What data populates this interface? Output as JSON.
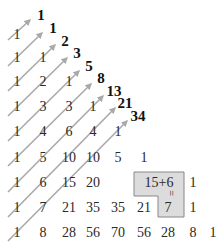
{
  "colors": {
    "arrow": "#a9a9a9",
    "box_fill": "#dcdcdc",
    "box_border": "#888888",
    "text": "#2a2a2a"
  },
  "rows": [
    [
      "1"
    ],
    [
      "1",
      "1"
    ],
    [
      "1",
      "2",
      "1"
    ],
    [
      "1",
      "3",
      "3",
      "1"
    ],
    [
      "1",
      "4",
      "6",
      "4",
      "1"
    ],
    [
      "1",
      "5",
      "10",
      "10",
      "5",
      "1"
    ],
    [
      "1",
      "6",
      "15",
      "20",
      "15+6",
      "1"
    ],
    [
      "1",
      "7",
      "21",
      "35",
      "35",
      "21",
      "7",
      "1"
    ],
    [
      "1",
      "8",
      "28",
      "56",
      "70",
      "56",
      "28",
      "8",
      "1"
    ]
  ],
  "fibonacci": [
    "1",
    "1",
    "2",
    "3",
    "5",
    "8",
    "13",
    "21",
    "34"
  ],
  "highlight": {
    "expression": "15+6",
    "equals_sign": "=",
    "result": "21"
  }
}
